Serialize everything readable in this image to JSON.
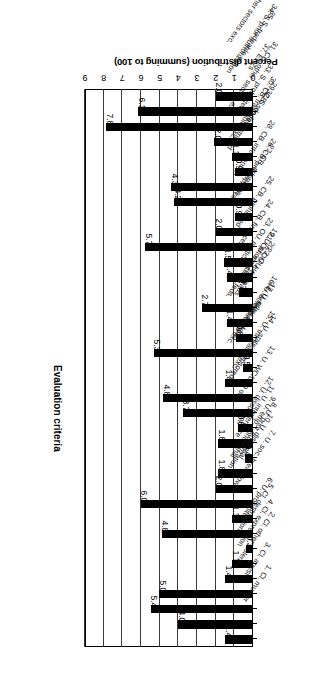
{
  "chart_data": {
    "type": "bar",
    "orientation": "horizontal",
    "title": "",
    "xlabel": "Percent distribution (summing to 100)",
    "ylabel": "Evaluation criteria",
    "xlim": [
      0,
      9
    ],
    "xticks": [
      "0",
      "1",
      "2",
      "3",
      "4",
      "5",
      "6",
      "7",
      "8",
      "9"
    ],
    "grid": true,
    "legend": "none",
    "rotation_note": "figure printed upside-down (180 degrees)",
    "categories": [
      "1. Cl. murder",
      "2. Cl. other violence",
      "3. Cl. arrest",
      "4. Cl. expression",
      "5. Cl. destruction",
      "6. U. prohibited",
      "7. U. soc. breakdown",
      "8. U. prior authorization",
      "9. U. emp. conditional",
      "10. U. dismissal",
      "11. U. interference",
      "12. U. dissolution",
      "13. U. WC/LC9 only",
      "14. U. state-sponsored",
      "15. U. tradeable exc.",
      "16. U. other sectors exc.",
      "17. U. other de facto",
      "18. U. federations",
      "19. U. prior auth. re feds.",
      "20. OU. elect leads.",
      "21. OU. elect reps.",
      "22. OU. rules",
      "23. OU. political",
      "24. CB. finances",
      "25. CB. prohibited",
      "26. CB. prior approval",
      "27. CB. arbitration",
      "28. CB. intervention",
      "29. CB. scope restricted",
      "30. CB. tradeable exc.",
      "31. CB. other sectors exc.",
      "32. S. de facto",
      "33. S. prohibited",
      "34. S. prior authorization",
      "35. S. tradeable exc.",
      "36. S. other sectors exc.",
      "37. EPZs"
    ],
    "values": [
      1.48,
      4.0,
      5.48,
      5.03,
      1.48,
      1.11,
      0.37,
      4.89,
      1.11,
      6.0,
      2.0,
      1.85,
      0.44,
      1.85,
      0.81,
      3.77,
      4.81,
      1.48,
      0.52,
      5.33,
      0.89,
      1.41,
      2.74,
      0.74,
      1.41,
      1.55,
      5.77,
      2.0,
      0.96,
      4.22,
      4.37,
      0.96,
      1.11,
      2.07,
      7.85,
      6.14,
      2.0
    ],
    "value_labels": [
      "1.48",
      "4.00",
      "5.48",
      "5.03",
      "1.48",
      "1.11",
      "0.37",
      "4.89",
      "1.11",
      "6.00",
      "2.00",
      "1.85",
      "0.44",
      "1.85",
      "0.81",
      "3.77",
      "4.81",
      "1.48",
      "0.52",
      "5.33",
      "0.89",
      "1.41",
      "2.74",
      "0.74",
      "1.41",
      "1.55",
      "5.77",
      "2.00",
      "0.96",
      "4.22",
      "4.37",
      "0.96",
      "1.11",
      "2.07",
      "7.85",
      "6.14",
      "2.00"
    ],
    "bar_color": "#000000",
    "axis_color": "#000000",
    "grid_color": "#3a3a3a"
  }
}
